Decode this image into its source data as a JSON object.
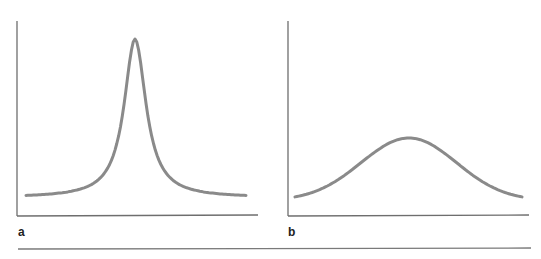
{
  "figure": {
    "rule_color": "#7a7a7a",
    "axis_color": "#6e6e6e",
    "curve_color": "#8a8a8a"
  },
  "chart_data": [
    {
      "type": "line",
      "panel_label": "a",
      "title": "",
      "xlabel": "",
      "ylabel": "",
      "shape": "lorentzian",
      "grid": false,
      "legend": null,
      "x": [
        -1.0,
        -0.8,
        -0.6,
        -0.4,
        -0.3,
        -0.2,
        -0.1,
        -0.05,
        0.0,
        0.05,
        0.1,
        0.2,
        0.3,
        0.4,
        0.6,
        0.8,
        1.0
      ],
      "y": [
        0.06,
        0.09,
        0.15,
        0.28,
        0.39,
        0.55,
        0.78,
        0.92,
        1.0,
        0.92,
        0.78,
        0.55,
        0.39,
        0.28,
        0.15,
        0.09,
        0.06
      ],
      "xlim": [
        -1.05,
        1.12
      ],
      "ylim": [
        0,
        1.08
      ]
    },
    {
      "type": "line",
      "panel_label": "b",
      "title": "",
      "xlabel": "",
      "ylabel": "",
      "shape": "gaussian",
      "grid": false,
      "legend": null,
      "x": [
        -1.0,
        -0.8,
        -0.6,
        -0.4,
        -0.2,
        0.0,
        0.2,
        0.4,
        0.6,
        0.8,
        1.0
      ],
      "y": [
        0.06,
        0.15,
        0.28,
        0.4,
        0.47,
        0.49,
        0.47,
        0.4,
        0.28,
        0.15,
        0.06
      ],
      "xlim": [
        -1.05,
        1.05
      ],
      "ylim": [
        0,
        1.08
      ]
    }
  ]
}
